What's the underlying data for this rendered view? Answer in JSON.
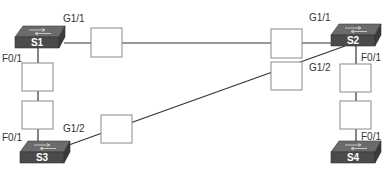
{
  "diagram": {
    "colors": {
      "line": "#333333",
      "box_stroke": "#8a8a8a",
      "box_fill": "#ffffff",
      "switch_top": "#6e6e6e",
      "switch_front": "#4a4a4a",
      "label": "#333333"
    },
    "switches": [
      {
        "id": "S1",
        "label": "S1"
      },
      {
        "id": "S2",
        "label": "S2"
      },
      {
        "id": "S3",
        "label": "S3"
      },
      {
        "id": "S4",
        "label": "S4"
      }
    ],
    "port_labels": {
      "s1_g11": "G1/1",
      "s1_f01": "F0/1",
      "s2_g11": "G1/1",
      "s2_g12": "G1/2",
      "s2_f01": "F0/1",
      "s3_f01": "F0/1",
      "s3_g12": "G1/2",
      "s4_f01": "F0/1"
    },
    "links": [
      {
        "from": "S1 G1/1",
        "to": "S2 G1/1",
        "boxes": 2
      },
      {
        "from": "S1 F0/1",
        "to": "S3 F0/1",
        "boxes": 2
      },
      {
        "from": "S3 G1/2",
        "to": "S2 G1/2",
        "boxes": 2
      },
      {
        "from": "S2 F0/1",
        "to": "S4 F0/1",
        "boxes": 2
      }
    ]
  }
}
